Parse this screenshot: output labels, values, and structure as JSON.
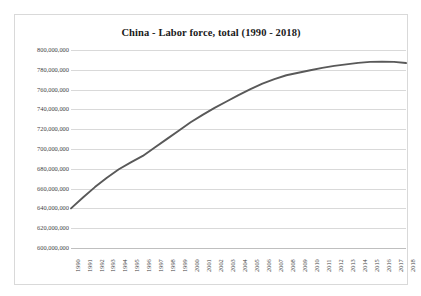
{
  "chart_data": {
    "type": "line",
    "title": "China - Labor force, total (1990 - 2018)",
    "xlabel": "",
    "ylabel": "",
    "grid": true,
    "legend": false,
    "legend_position": "none",
    "line_color": "#595959",
    "gridline_color": "#D9D9D9",
    "border_color": "#D9D9D9",
    "ylim": [
      600000000,
      800000000
    ],
    "y_ticks": [
      600000000,
      620000000,
      640000000,
      660000000,
      680000000,
      700000000,
      720000000,
      740000000,
      760000000,
      780000000,
      800000000
    ],
    "y_tick_labels": [
      "600,000,000",
      "620,000,000",
      "640,000,000",
      "660,000,000",
      "680,000,000",
      "700,000,000",
      "720,000,000",
      "740,000,000",
      "760,000,000",
      "780,000,000",
      "800,000,000"
    ],
    "categories": [
      "1990",
      "1991",
      "1992",
      "1993",
      "1994",
      "1995",
      "1996",
      "1997",
      "1998",
      "1999",
      "2000",
      "2001",
      "2002",
      "2003",
      "2004",
      "2005",
      "2006",
      "2007",
      "2008",
      "2009",
      "2010",
      "2011",
      "2012",
      "2013",
      "2014",
      "2015",
      "2016",
      "2017",
      "2018"
    ],
    "series": [
      {
        "name": "Labor force, total",
        "values": [
          640000000,
          651000000,
          661500000,
          671000000,
          679500000,
          686500000,
          693000000,
          701500000,
          710000000,
          718500000,
          727000000,
          734500000,
          741500000,
          748000000,
          754500000,
          760500000,
          766000000,
          770500000,
          774500000,
          777000000,
          779500000,
          782000000,
          784000000,
          785500000,
          787000000,
          788000000,
          788200000,
          788000000,
          786800000
        ]
      }
    ]
  }
}
